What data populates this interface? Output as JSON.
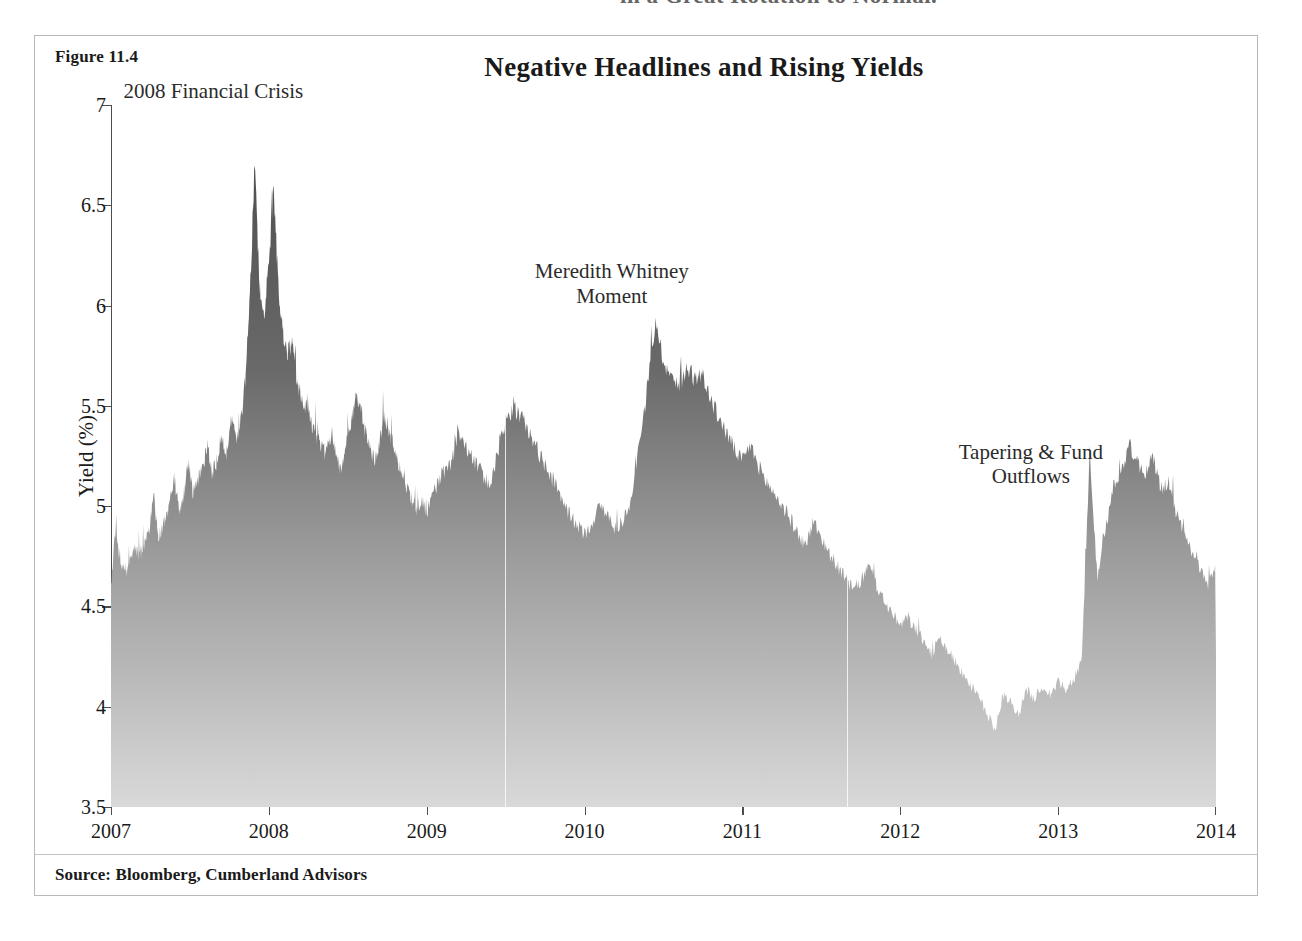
{
  "page": {
    "top_fragment_text": "in a Great Rotation to Normal."
  },
  "figure": {
    "label": "Figure 11.4",
    "title": "Negative Headlines and Rising Yields",
    "source": "Source: Bloomberg, Cumberland Advisors",
    "frame_color": "#b9b9b9",
    "fill_top_color": "#4f4f4f",
    "fill_bottom_color": "#d9d9d9",
    "axis_color": "#4d4d4d"
  },
  "annotations": [
    {
      "name": "crisis-2008",
      "text": "2008 Financial Crisis",
      "x_pct": 14.6,
      "y_pct": 5.0
    },
    {
      "name": "meredith-whitney",
      "text": "Meredith Whitney\nMoment",
      "x_pct": 47.2,
      "y_pct": 26.0
    },
    {
      "name": "tapering",
      "text": "Tapering & Fund Outflows",
      "x_pct": 81.5,
      "y_pct": 47.0
    }
  ],
  "chart_data": {
    "type": "area",
    "title": "Negative Headlines and Rising Yields",
    "xlabel": "",
    "ylabel": "Yield (%)",
    "xlim": [
      2007,
      2014
    ],
    "ylim": [
      3.5,
      7
    ],
    "grid": false,
    "legend": null,
    "ytick_labels": [
      "7",
      "6.5",
      "6",
      "5.5",
      "5",
      "4.5",
      "4",
      "3.5"
    ],
    "ytick_values": [
      7,
      6.5,
      6,
      5.5,
      5,
      4.5,
      4,
      3.5
    ],
    "xtick_labels": [
      "2007",
      "2008",
      "2009",
      "2010",
      "2011",
      "2012",
      "2013",
      "2014"
    ],
    "xtick_values": [
      2007,
      2008,
      2009,
      2010,
      2011,
      2012,
      2013,
      2014
    ],
    "series_name": "Municipal bond yield",
    "x": [
      2007.0,
      2007.03,
      2007.06,
      2007.09,
      2007.12,
      2007.15,
      2007.18,
      2007.21,
      2007.24,
      2007.27,
      2007.3,
      2007.33,
      2007.36,
      2007.4,
      2007.43,
      2007.46,
      2007.49,
      2007.52,
      2007.55,
      2007.58,
      2007.61,
      2007.64,
      2007.67,
      2007.7,
      2007.73,
      2007.76,
      2007.79,
      2007.82,
      2007.85,
      2007.88,
      2007.91,
      2007.94,
      2007.97,
      2008.0,
      2008.03,
      2008.06,
      2008.09,
      2008.12,
      2008.15,
      2008.18,
      2008.21,
      2008.24,
      2008.27,
      2008.3,
      2008.33,
      2008.36,
      2008.4,
      2008.43,
      2008.46,
      2008.49,
      2008.52,
      2008.55,
      2008.58,
      2008.61,
      2008.64,
      2008.67,
      2008.7,
      2008.73,
      2008.76,
      2008.79,
      2008.82,
      2008.85,
      2008.88,
      2008.91,
      2008.94,
      2008.97,
      2009.0,
      2009.05,
      2009.1,
      2009.15,
      2009.2,
      2009.25,
      2009.3,
      2009.35,
      2009.4,
      2009.45,
      2009.5,
      2009.55,
      2009.6,
      2009.65,
      2009.7,
      2009.75,
      2009.8,
      2009.85,
      2009.9,
      2009.95,
      2010.0,
      2010.05,
      2010.1,
      2010.15,
      2010.2,
      2010.25,
      2010.3,
      2010.35,
      2010.4,
      2010.45,
      2010.5,
      2010.55,
      2010.6,
      2010.65,
      2010.7,
      2010.75,
      2010.8,
      2010.85,
      2010.9,
      2010.95,
      2011.0,
      2011.05,
      2011.1,
      2011.15,
      2011.2,
      2011.25,
      2011.3,
      2011.35,
      2011.4,
      2011.45,
      2011.5,
      2011.55,
      2011.6,
      2011.65,
      2011.7,
      2011.75,
      2011.8,
      2011.85,
      2011.9,
      2011.95,
      2012.0,
      2012.05,
      2012.1,
      2012.15,
      2012.2,
      2012.25,
      2012.3,
      2012.35,
      2012.4,
      2012.45,
      2012.5,
      2012.55,
      2012.6,
      2012.65,
      2012.7,
      2012.75,
      2012.8,
      2012.85,
      2012.9,
      2012.95,
      2013.0,
      2013.05,
      2013.1,
      2013.15,
      2013.2,
      2013.25,
      2013.3,
      2013.35,
      2013.4,
      2013.45,
      2013.5,
      2013.55,
      2013.6,
      2013.65,
      2013.7,
      2013.75,
      2013.8,
      2013.85,
      2013.9,
      2013.95,
      2014.0
    ],
    "y": [
      4.62,
      4.88,
      4.7,
      4.66,
      4.72,
      4.78,
      4.74,
      4.8,
      4.86,
      5.06,
      4.84,
      4.9,
      4.96,
      5.14,
      4.98,
      5.04,
      5.22,
      5.06,
      5.12,
      5.18,
      5.3,
      5.16,
      5.22,
      5.34,
      5.26,
      5.44,
      5.32,
      5.4,
      5.62,
      6.02,
      6.72,
      6.1,
      5.96,
      6.2,
      6.6,
      6.08,
      5.86,
      5.76,
      5.82,
      5.6,
      5.54,
      5.48,
      5.4,
      5.34,
      5.3,
      5.26,
      5.36,
      5.22,
      5.18,
      5.28,
      5.42,
      5.54,
      5.5,
      5.36,
      5.28,
      5.22,
      5.3,
      5.44,
      5.38,
      5.3,
      5.22,
      5.14,
      5.08,
      5.02,
      4.98,
      5.02,
      4.96,
      5.08,
      5.16,
      5.2,
      5.34,
      5.28,
      5.22,
      5.16,
      5.1,
      5.26,
      5.42,
      5.48,
      5.44,
      5.36,
      5.28,
      5.2,
      5.12,
      5.04,
      4.96,
      4.9,
      4.86,
      4.92,
      5.0,
      4.94,
      4.88,
      4.94,
      5.02,
      5.3,
      5.6,
      5.93,
      5.72,
      5.64,
      5.58,
      5.7,
      5.62,
      5.66,
      5.52,
      5.44,
      5.36,
      5.28,
      5.22,
      5.3,
      5.2,
      5.12,
      5.06,
      5.0,
      4.94,
      4.86,
      4.8,
      4.92,
      4.84,
      4.76,
      4.7,
      4.64,
      4.58,
      4.62,
      4.7,
      4.6,
      4.52,
      4.46,
      4.4,
      4.44,
      4.38,
      4.32,
      4.26,
      4.34,
      4.28,
      4.22,
      4.16,
      4.1,
      4.04,
      3.96,
      3.88,
      4.06,
      4.02,
      3.96,
      4.08,
      4.04,
      4.1,
      4.06,
      4.12,
      4.08,
      4.14,
      4.24,
      5.26,
      4.62,
      4.88,
      5.1,
      5.18,
      5.3,
      5.22,
      5.16,
      5.24,
      5.08,
      5.12,
      4.96,
      4.84,
      4.76,
      4.68,
      4.6,
      4.7,
      4.62,
      4.56,
      4.48,
      4.54,
      4.46,
      4.4,
      4.52,
      4.44,
      4.38,
      4.46,
      4.3,
      4.36,
      4.28,
      4.34,
      4.26
    ],
    "annotated_points": [
      {
        "label": "2008 Financial Crisis peak",
        "x": 2007.91,
        "y": 6.72
      },
      {
        "label": "2008 secondary peak",
        "x": 2008.03,
        "y": 6.6
      },
      {
        "label": "Meredith Whitney Moment peak",
        "x": 2010.45,
        "y": 5.93
      },
      {
        "label": "2012 trough",
        "x": 2012.4,
        "y": 3.87
      },
      {
        "label": "Tapering peak",
        "x": 2012.72,
        "y": 5.3
      },
      {
        "label": "2014 end value",
        "x": 2014.0,
        "y": 4.26
      }
    ]
  }
}
